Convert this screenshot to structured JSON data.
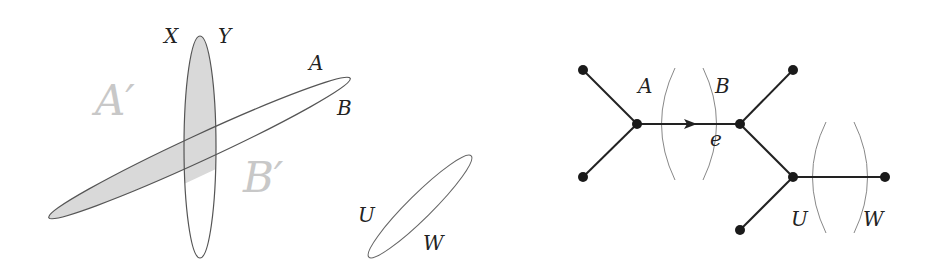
{
  "colors": {
    "ink": "#222222",
    "outline": "#555555",
    "shade": "#d9d9d9",
    "faint_label": "#c8c8c8",
    "cut_arc": "#888888"
  },
  "left_diagram": {
    "labels": {
      "X": "X",
      "Y": "Y",
      "A": "A",
      "B": "B",
      "A_prime": "A′",
      "B_prime": "B′",
      "U": "U",
      "W": "W"
    },
    "sets": [
      {
        "name": "XY-set",
        "shape": "vertical-ellipse",
        "shaded_upper": true
      },
      {
        "name": "AB-set",
        "shape": "tilted-ellipse",
        "shaded_left": true
      },
      {
        "name": "UW-set",
        "shape": "small-tilted-ellipse",
        "shaded": false
      }
    ]
  },
  "right_diagram": {
    "labels": {
      "A": "A",
      "B": "B",
      "e": "e",
      "U": "U",
      "W": "W"
    },
    "nodes": [
      {
        "id": "leaf-top-left",
        "x": 583,
        "y": 70
      },
      {
        "id": "leaf-bottom-left",
        "x": 583,
        "y": 177
      },
      {
        "id": "internal-left",
        "x": 637,
        "y": 124
      },
      {
        "id": "internal-middle",
        "x": 740,
        "y": 124
      },
      {
        "id": "leaf-top-right",
        "x": 793,
        "y": 70
      },
      {
        "id": "internal-lower",
        "x": 793,
        "y": 177
      },
      {
        "id": "leaf-right",
        "x": 885,
        "y": 177
      },
      {
        "id": "leaf-bottom",
        "x": 740,
        "y": 230
      }
    ],
    "edges": [
      [
        "leaf-top-left",
        "internal-left"
      ],
      [
        "leaf-bottom-left",
        "internal-left"
      ],
      [
        "internal-left",
        "internal-middle"
      ],
      [
        "internal-middle",
        "leaf-top-right"
      ],
      [
        "internal-middle",
        "internal-lower"
      ],
      [
        "internal-lower",
        "leaf-right"
      ],
      [
        "internal-lower",
        "leaf-bottom"
      ]
    ],
    "directed_edge": {
      "from": "internal-left",
      "to": "internal-middle",
      "label": "e"
    }
  }
}
